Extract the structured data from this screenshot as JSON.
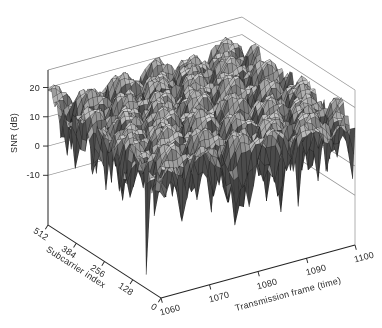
{
  "figure": {
    "width_px": 382,
    "height_px": 328,
    "background": "#ffffff",
    "title": ""
  },
  "chart_data": {
    "type": "surface",
    "title": "",
    "axes": {
      "x": {
        "label": "Transmission frame (time)",
        "range": [
          1060,
          1100
        ],
        "ticks": [
          1060,
          1070,
          1080,
          1090,
          1100
        ]
      },
      "y": {
        "label": "Subcarrier index",
        "range": [
          0,
          512
        ],
        "ticks": [
          512,
          384,
          256,
          128,
          0
        ]
      },
      "z": {
        "label": "SNR (dB)",
        "range": [
          -27,
          26
        ],
        "ticks": [
          20,
          10,
          0,
          -10
        ]
      }
    },
    "surface": {
      "description": "Per-subcarrier SNR over time: smooth frequency-selective fading bumps (peaks about 20 dB) with deep narrow fade notches plunging below -25 dB",
      "snr_offset_db": 12,
      "snr_peak_db": 21.5,
      "snr_floor_clamp_db": -26.5,
      "grid": {
        "time_points": 45,
        "subcarrier_points": 100
      },
      "taps": [
        {
          "a": 1.0,
          "fs": 0.0,
          "ft": 0.0,
          "p": 0.0
        },
        {
          "a": 0.8,
          "fs": 0.0077,
          "ft": 0.085,
          "p": 0.7
        },
        {
          "a": 0.5,
          "fs": 0.0133,
          "ft": -0.055,
          "p": 2.3
        },
        {
          "a": 0.35,
          "fs": 0.0263,
          "ft": 0.14,
          "p": 4.1
        },
        {
          "a": 0.22,
          "fs": 0.0476,
          "ft": -0.2,
          "p": 1.9
        },
        {
          "a": 0.12,
          "fs": 0.0909,
          "ft": 0.31,
          "p": 5.0
        }
      ]
    },
    "colors": {
      "mesh_line": "#141414",
      "wall_line": "#8f8f8f",
      "axis_line": "#222222",
      "text": "#2a2a2a",
      "background": "#ffffff"
    },
    "legend": null
  }
}
